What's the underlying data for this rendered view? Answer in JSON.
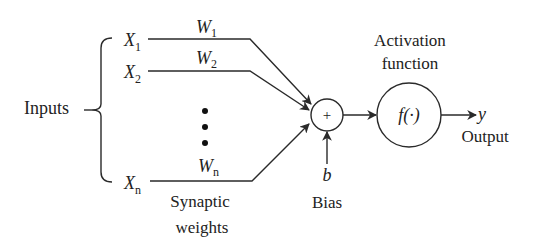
{
  "diagram": {
    "inputs_label": "Inputs",
    "inputs": [
      {
        "symbol": "X",
        "subscript": "1",
        "weight_symbol": "W",
        "weight_subscript": "1"
      },
      {
        "symbol": "X",
        "subscript": "2",
        "weight_symbol": "W",
        "weight_subscript": "2"
      },
      {
        "symbol": "X",
        "subscript": "n",
        "weight_symbol": "W",
        "weight_subscript": "n"
      }
    ],
    "ellipsis": "⋮",
    "weights_label_line1": "Synaptic",
    "weights_label_line2": "weights",
    "summation": {
      "symbol": "+"
    },
    "bias": {
      "symbol": "b",
      "label": "Bias"
    },
    "activation": {
      "label_line1": "Activation",
      "label_line2": "function",
      "symbol": "f(·)"
    },
    "output": {
      "symbol": "y",
      "label": "Output"
    },
    "colors": {
      "stroke": "#2a2a2a",
      "text": "#222222",
      "background": "#ffffff"
    }
  }
}
